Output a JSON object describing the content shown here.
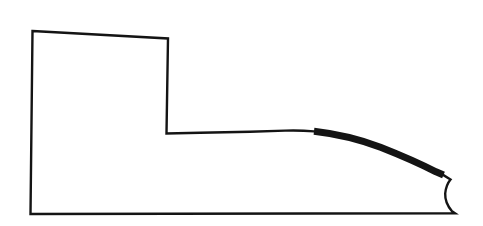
{
  "document": {
    "kind": "technical-line-drawing",
    "title": "",
    "caption": "",
    "background_color": "#ffffff",
    "ink_color": "#141414",
    "canvas": {
      "width": 483,
      "height": 226
    }
  },
  "figure": {
    "name": "stepped-profile-outline",
    "stroke_color": "#141414",
    "thin_stroke_width": 2.4,
    "thick_stroke_width": 7.0,
    "fill": "none",
    "vertices": {
      "top_left": [
        32,
        31
      ],
      "top_right_of_block": [
        168,
        38
      ],
      "block_bottom_right": [
        166,
        134
      ],
      "shoulder_start": [
        167,
        133
      ],
      "taper_begin": [
        300,
        130
      ],
      "thick_band_start": [
        314,
        131
      ],
      "thick_band_end": [
        443,
        174
      ],
      "notch_outer_corner": [
        450,
        179
      ],
      "notch_waist": [
        445,
        194
      ],
      "notch_bottom": [
        455,
        212
      ],
      "bottom_right": [
        455,
        213
      ],
      "bottom_left": [
        30,
        214
      ]
    },
    "segments": [
      {
        "id": "top-edge",
        "type": "line",
        "weight": "thin",
        "from": "top_left",
        "to": "top_right_of_block"
      },
      {
        "id": "block-right-edge",
        "type": "line",
        "weight": "thin",
        "from": "top_right_of_block",
        "to": "block_bottom_right"
      },
      {
        "id": "shoulder-edge",
        "type": "line",
        "weight": "thin",
        "from": "shoulder_start",
        "to": "taper_begin"
      },
      {
        "id": "taper-lead-in",
        "type": "curve",
        "weight": "thin",
        "from": "taper_begin",
        "to": "thick_band_start"
      },
      {
        "id": "highlighted-taper-curve",
        "type": "curve",
        "weight": "thick",
        "from": "thick_band_start",
        "to": "thick_band_end"
      },
      {
        "id": "notch-upper",
        "type": "line",
        "weight": "thin",
        "from": "thick_band_end",
        "to": "notch_outer_corner"
      },
      {
        "id": "notch-concave",
        "type": "curve",
        "weight": "thin",
        "from": "notch_outer_corner",
        "to": "notch_bottom"
      },
      {
        "id": "bottom-edge",
        "type": "line",
        "weight": "thin",
        "from": "bottom_right",
        "to": "bottom_left"
      },
      {
        "id": "left-edge",
        "type": "line",
        "weight": "thin",
        "from": "bottom_left",
        "to": "top_left"
      }
    ],
    "paths": {
      "outline": "M 32.5 31 L 168 38.5 L 166.5 133.5 L 200 132.8 L 250 131.8 L 285 130.6 Q 300 130.1 314 131.4 Q 350 135.5 381 147.5 Q 414 160.5 436.5 172.5 L 443.5 175.2 L 450.5 179.5 Q 446 185 445.2 193.5 Q 444.8 203 452 211.2 L 455 213.2 L 30.5 214 Z",
      "thick_overlay": "M 314 131.2 Q 349 135.2 380.5 147.2 Q 413 160 436 171.8 L 443.5 175.0"
    }
  }
}
